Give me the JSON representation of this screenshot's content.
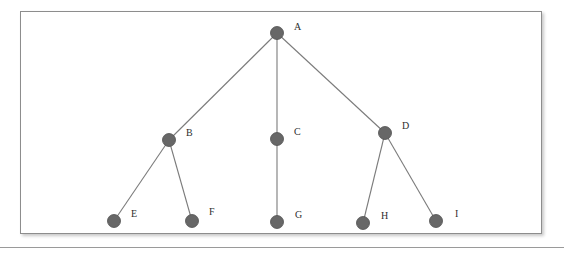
{
  "figure": {
    "background_color": "#ffffff",
    "frame": {
      "border_color": "#8d8d8d",
      "fill_color": "#ffffff",
      "x": 20,
      "y": 11,
      "width": 522,
      "height": 223
    },
    "footer_rule_color": "#9a9a9a",
    "node_color": "#676767",
    "node_stroke_color": "#4e4e4e",
    "edge_color": "#7b7b7b",
    "label_color": "#2e2e2e",
    "node_radius": 6.5
  },
  "graph": {
    "type": "tree",
    "root": "A",
    "nodes": [
      {
        "id": "A",
        "label": "A",
        "x": 277,
        "y": 33,
        "label_x": 294,
        "label_y": 30,
        "level": 0
      },
      {
        "id": "B",
        "label": "B",
        "x": 169,
        "y": 140,
        "label_x": 186,
        "label_y": 136,
        "level": 1
      },
      {
        "id": "C",
        "label": "C",
        "x": 277,
        "y": 139,
        "label_x": 294,
        "label_y": 135,
        "level": 1
      },
      {
        "id": "D",
        "label": "D",
        "x": 385,
        "y": 133,
        "label_x": 402,
        "label_y": 129,
        "level": 1
      },
      {
        "id": "E",
        "label": "E",
        "x": 114,
        "y": 221,
        "label_x": 131,
        "label_y": 217,
        "level": 2
      },
      {
        "id": "F",
        "label": "F",
        "x": 192,
        "y": 221,
        "label_x": 209,
        "label_y": 215,
        "level": 2
      },
      {
        "id": "G",
        "label": "G",
        "x": 277,
        "y": 222,
        "label_x": 295,
        "label_y": 218,
        "level": 2
      },
      {
        "id": "H",
        "label": "H",
        "x": 363,
        "y": 223,
        "label_x": 381,
        "label_y": 219,
        "level": 2
      },
      {
        "id": "I",
        "label": "I",
        "x": 436,
        "y": 221,
        "label_x": 455,
        "label_y": 217,
        "level": 2
      }
    ],
    "edges": [
      {
        "from": "A",
        "to": "B"
      },
      {
        "from": "A",
        "to": "C"
      },
      {
        "from": "A",
        "to": "D"
      },
      {
        "from": "B",
        "to": "E"
      },
      {
        "from": "B",
        "to": "F"
      },
      {
        "from": "C",
        "to": "G"
      },
      {
        "from": "D",
        "to": "H"
      },
      {
        "from": "D",
        "to": "I"
      }
    ]
  }
}
